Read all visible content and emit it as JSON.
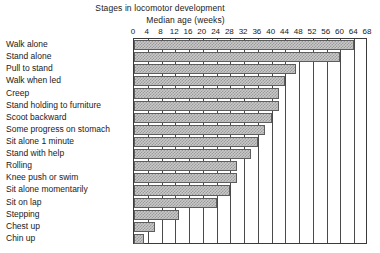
{
  "chart_data": {
    "type": "bar",
    "orientation": "horizontal",
    "title": "Stages in locomotor development",
    "xlabel": "Median age (weeks)",
    "ylabel": "",
    "xlim": [
      0,
      68
    ],
    "xticks": [
      0,
      4,
      8,
      12,
      16,
      20,
      24,
      28,
      32,
      36,
      40,
      44,
      48,
      52,
      56,
      60,
      64,
      68
    ],
    "grid": true,
    "legend": false,
    "categories": [
      "Walk alone",
      "Stand alone",
      "Pull to stand",
      "Walk when led",
      "Creep",
      "Stand holding to furniture",
      "Scoot backward",
      "Some progress on stomach",
      "Sit alone 1 minute",
      "Stand with help",
      "Rolling",
      "Knee push or swim",
      "Sit alone momentarily",
      "Sit on lap",
      "Stepping",
      "Chest up",
      "Chin up"
    ],
    "values": [
      64,
      60,
      47,
      44,
      42,
      42,
      40,
      38,
      36,
      34,
      30,
      30,
      28,
      24,
      13,
      6,
      3
    ],
    "value_unit": "weeks",
    "bar_fill": "#c9c9c9",
    "bar_hatch": "#9a9a9a",
    "bar_border": "#5d5d5d",
    "frame_color": "#3a3a3a"
  }
}
